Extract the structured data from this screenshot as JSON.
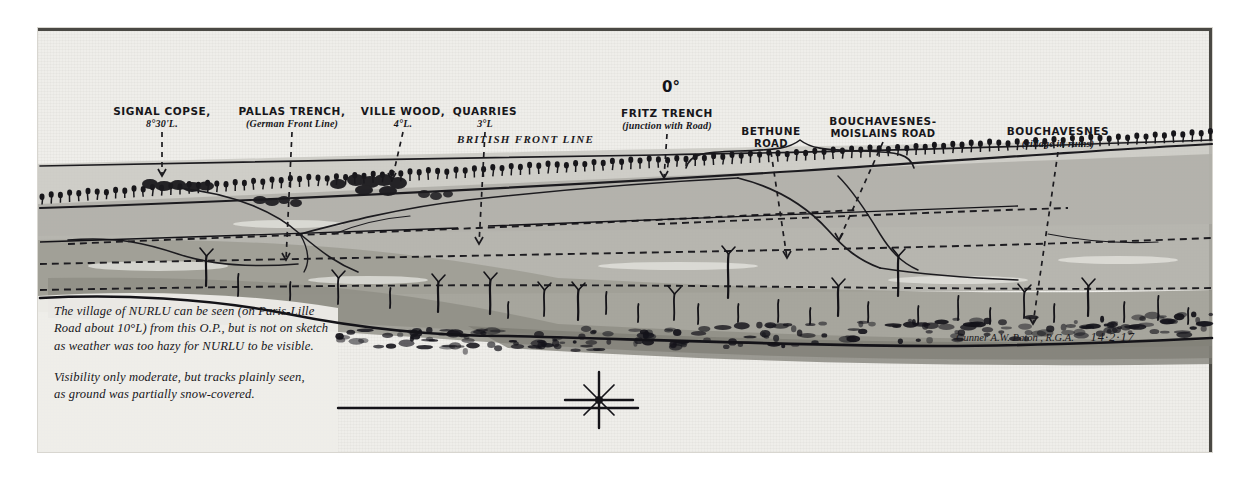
{
  "sheet": {
    "kind": "panorama-sketch",
    "orientation_marker": "0°"
  },
  "labels": [
    {
      "name": "signal-copse",
      "line1": "SIGNAL COPSE,",
      "line2": "8°30'L.",
      "x": 124,
      "y": 78,
      "tip_x": 124,
      "tip_y": 148
    },
    {
      "name": "pallas-trench",
      "line1": "PALLAS TRENCH,",
      "line2": "(German Front Line)",
      "x": 254,
      "y": 78,
      "tip_x": 248,
      "tip_y": 232
    },
    {
      "name": "ville-wood",
      "line1": "VILLE WOOD,",
      "line2": "4°L.",
      "x": 365,
      "y": 78,
      "tip_x": 354,
      "tip_y": 152
    },
    {
      "name": "quarries",
      "line1": "QUARRIES",
      "line2": "3°L",
      "x": 447,
      "y": 78,
      "tip_x": 441,
      "tip_y": 216
    },
    {
      "name": "fritz-trench",
      "line1": "FRITZ TRENCH",
      "line2": "(junction with Road)",
      "x": 629,
      "y": 80,
      "tip_x": 626,
      "tip_y": 150
    },
    {
      "name": "bethune-road",
      "line1": "BETHUNE",
      "line2": "ROAD",
      "x": 733,
      "y": 98,
      "tip_x": 749,
      "tip_y": 230
    },
    {
      "name": "bouchavesnes-moislains-road",
      "line1": "BOUCHAVESNES-",
      "line2": "MOISLAINS ROAD",
      "x": 845,
      "y": 88,
      "tip_x": 801,
      "tip_y": 212
    },
    {
      "name": "bouchavesnes-village",
      "line1": "BOUCHAVESNES",
      "line2": "(village in ruins)",
      "x": 1020,
      "y": 98,
      "tip_x": 995,
      "tip_y": 296
    }
  ],
  "front_line_label": "BRITISH FRONT LINE",
  "notes": [
    {
      "name": "nurlu-note",
      "lines": [
        "The village of NURLU can be seen (on Paris-Lille",
        "Road about 10°L) from this O.P., but is not on sketch",
        "as weather was too hazy for NURLU to be visible."
      ]
    },
    {
      "name": "visibility-note",
      "lines": [
        "Visibility only moderate, but tracks plainly seen,",
        "as ground was partially snow-covered."
      ]
    }
  ],
  "signature": {
    "author": "Gunner A.W. Paton , R.G.A.",
    "date": "14·2·17"
  },
  "compass": {
    "name": "starburst-compass",
    "rays": 8
  },
  "chart_data": {
    "type": "line",
    "xlabel": "Bearing (degrees left of 0°)",
    "ylabel": "Skyline",
    "grid": false,
    "legend": "none",
    "annotations": [
      {
        "label": "SIGNAL COPSE",
        "bearing_deg_left": 8.5
      },
      {
        "label": "VILLE WOOD",
        "bearing_deg_left": 4.0
      },
      {
        "label": "QUARRIES",
        "bearing_deg_left": 3.0
      },
      {
        "label": "NURLU (not drawn)",
        "bearing_deg_left": 10.0
      },
      {
        "label": "0° datum",
        "bearing_deg_left": 0.0
      }
    ]
  },
  "colors": {
    "paper": "#efeeea",
    "ink": "#17161a",
    "rule": "#4a4944",
    "wash_far": "#bdbcb6",
    "wash_mid": "#a9a8a1",
    "wash_near": "#8f8e87"
  }
}
